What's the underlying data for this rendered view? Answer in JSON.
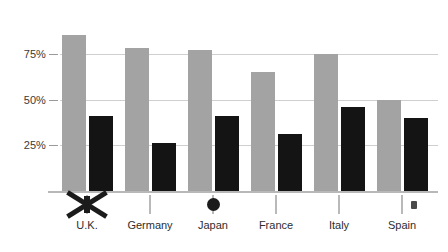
{
  "chart_data": {
    "type": "bar",
    "title": "",
    "xlabel": "",
    "ylabel": "",
    "ylim": [
      0,
      100
    ],
    "grid": true,
    "legend_position": "x-axis-flags",
    "categories": [
      "U.K.",
      "Germany",
      "Japan",
      "France",
      "Italy",
      "Spain"
    ],
    "ytick_labels": [
      "75%",
      "50%",
      "25%"
    ],
    "ytick_values": [
      75,
      50,
      25
    ],
    "series": [
      {
        "name": "series-gray",
        "color": "#a3a3a3",
        "values": [
          85,
          78,
          77,
          65,
          75,
          50
        ]
      },
      {
        "name": "series-black",
        "color": "#141414",
        "values": [
          41,
          26,
          41,
          31,
          46,
          40
        ]
      }
    ]
  },
  "legend": {
    "items": [
      {
        "label": "U.K.",
        "flag": "flag-uk-icon"
      },
      {
        "label": "Germany",
        "flag": "flag-germany-icon"
      },
      {
        "label": "Japan",
        "flag": "flag-japan-icon"
      },
      {
        "label": "France",
        "flag": "flag-france-icon"
      },
      {
        "label": "Italy",
        "flag": "flag-italy-icon"
      },
      {
        "label": "Spain",
        "flag": "flag-spain-icon"
      }
    ]
  }
}
